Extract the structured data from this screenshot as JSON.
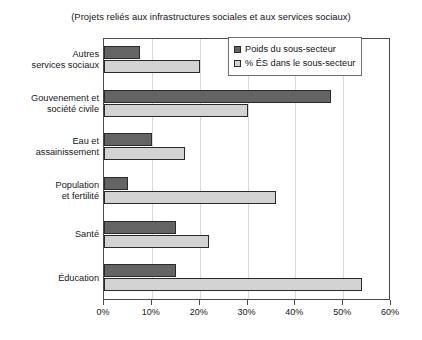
{
  "chart_data": {
    "type": "bar",
    "orientation": "horizontal",
    "title": "(Projets reliés aux infrastructures sociales et aux services sociaux)",
    "xlabel": "",
    "ylabel": "",
    "xlim": [
      0,
      60
    ],
    "xticks": [
      0,
      10,
      20,
      30,
      40,
      50,
      60
    ],
    "xtick_labels": [
      "0%",
      "10%",
      "20%",
      "30%",
      "40%",
      "50%",
      "60%"
    ],
    "grid": "vertical",
    "legend_position": "top-right",
    "categories": [
      "Autres\nservices sociaux",
      "Gouvenement et\nsociété civile",
      "Eau et\nassainissement",
      "Population\net fertilité",
      "Santé",
      "Éducation"
    ],
    "series": [
      {
        "name": "Poids du sous-secteur",
        "color": "#646464",
        "values": [
          7.5,
          47.5,
          10,
          5,
          15,
          15
        ]
      },
      {
        "name": "% ÉS dans le sous-secteur",
        "color": "#d3d3d3",
        "values": [
          20,
          30,
          17,
          36,
          22,
          54
        ]
      }
    ]
  },
  "legend": {
    "entries": [
      {
        "label": "Poids du sous-secteur",
        "color": "#646464"
      },
      {
        "label": "% ÉS dans le sous-secteur",
        "color": "#d3d3d3"
      }
    ]
  }
}
